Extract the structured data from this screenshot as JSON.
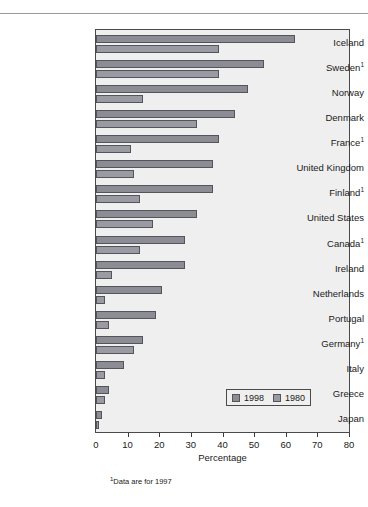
{
  "chart_data": {
    "type": "bar",
    "orientation": "horizontal",
    "title": "",
    "xlabel": "Percentage",
    "ylabel": "",
    "xlim": [
      0,
      80
    ],
    "xticks": [
      0,
      10,
      20,
      30,
      40,
      50,
      60,
      70,
      80
    ],
    "grid": false,
    "legend_position": "bottom-right",
    "categories": [
      "Iceland",
      "Sweden¹",
      "Norway",
      "Denmark",
      "France¹",
      "United Kingdom",
      "Finland¹",
      "United States",
      "Canada¹",
      "Ireland",
      "Netherlands",
      "Portugal",
      "Germany¹",
      "Italy",
      "Greece",
      "Japan"
    ],
    "series": [
      {
        "name": "1998",
        "color": "#8c8c94",
        "values": [
          63,
          53,
          48,
          44,
          39,
          37,
          37,
          32,
          28,
          28,
          21,
          19,
          15,
          9,
          4,
          2
        ]
      },
      {
        "name": "1980",
        "color": "#9a9aa2",
        "values": [
          39,
          39,
          15,
          32,
          11,
          12,
          14,
          18,
          14,
          5,
          3,
          4,
          12,
          3,
          3,
          1
        ]
      }
    ],
    "annotations": [
      "¹Data are for 1997"
    ]
  },
  "axis": {
    "x_title": "Percentage",
    "tick_labels": [
      "0",
      "10",
      "20",
      "30",
      "40",
      "50",
      "60",
      "70",
      "80"
    ]
  },
  "legend": {
    "items": [
      {
        "label": "1998"
      },
      {
        "label": "1980"
      }
    ]
  },
  "footnote": {
    "marker": "1",
    "text": "Data are for 1997"
  },
  "colors": {
    "series_1998": "#8c8c94",
    "series_1980": "#9a9aa2",
    "plot_background": "#efefef",
    "frame": "#4a4a4a",
    "bar_outline": "#54545a"
  }
}
